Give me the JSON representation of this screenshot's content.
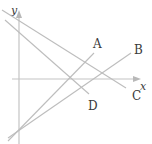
{
  "diagram": {
    "type": "coordinate-plane-lines",
    "axes": {
      "x_label": "x",
      "y_label": "y",
      "origin_px": [
        19,
        79
      ]
    },
    "lines": [
      {
        "label": "A",
        "from": [
          8,
          141
        ],
        "to": [
          94,
          53
        ],
        "label_pos": [
          93,
          48
        ]
      },
      {
        "label": "B",
        "from": [
          8,
          138
        ],
        "to": [
          131,
          53
        ],
        "label_pos": [
          134,
          54
        ]
      },
      {
        "label": "C",
        "from": [
          2,
          10
        ],
        "to": [
          126,
          88
        ],
        "label_pos": [
          132,
          100
        ]
      },
      {
        "label": "D",
        "from": [
          5,
          20
        ],
        "to": [
          89,
          94
        ],
        "label_pos": [
          88,
          110
        ]
      }
    ],
    "colors": {
      "line": "#bdbdbd",
      "axis": "#c4c4c4",
      "text": "#3a3a3a"
    }
  }
}
